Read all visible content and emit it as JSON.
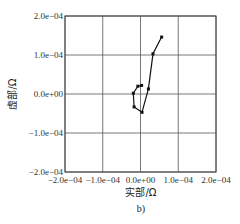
{
  "chart_data": {
    "type": "line",
    "title": "",
    "xlabel": "实部/Ω",
    "ylabel": "虚部/Ω",
    "caption": "b)",
    "xlim": [
      -0.0002,
      0.0002
    ],
    "ylim": [
      -0.0002,
      0.0002
    ],
    "grid": true,
    "legend": null,
    "x_ticks": [
      "-2.0e-04",
      "-1.0e-04",
      "0.0e+00",
      "1.0e-04",
      "2.0e-04"
    ],
    "y_ticks": [
      "2.0e-04",
      "1.0e-04",
      "0.0e+00",
      "-1.0e-04",
      "-2.0e-04"
    ],
    "series": [
      {
        "name": "impedance",
        "color": "#111111",
        "marker": "square",
        "points": [
          {
            "x": 5.6e-05,
            "y": 0.000146
          },
          {
            "x": 3.3e-05,
            "y": 0.000103
          },
          {
            "x": 2.1e-05,
            "y": 1.3e-05
          },
          {
            "x": 4e-06,
            "y": -4.7e-05
          },
          {
            "x": -1.7e-05,
            "y": -3.3e-05
          },
          {
            "x": -1.9e-05,
            "y": 2e-06
          },
          {
            "x": -7e-06,
            "y": 2e-05
          },
          {
            "x": 3e-06,
            "y": 2.2e-05
          }
        ]
      }
    ]
  }
}
